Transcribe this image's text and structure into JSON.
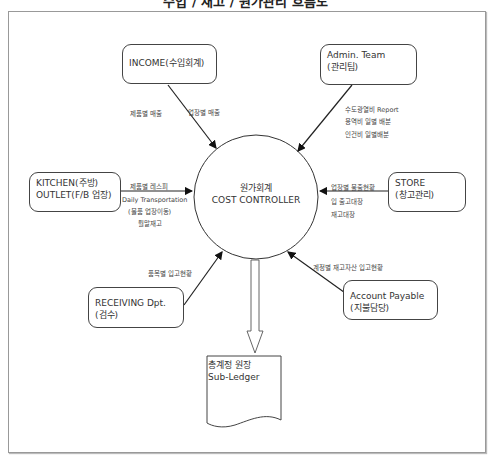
{
  "title": "수입 / 재고 / 원가관리 흐름도",
  "center": {
    "line1": "원가회계",
    "line2": "COST CONTROLLER"
  },
  "boxes": {
    "income": {
      "line1": "INCOME(수입회계)"
    },
    "admin": {
      "line1": "Admin. Team",
      "line2": "(관리팀)"
    },
    "kitchen": {
      "line1": "KITCHEN(주방)",
      "line2": "OUTLET(F/B 업장)"
    },
    "store": {
      "line1": "STORE",
      "line2": "(창고관리)"
    },
    "receiving": {
      "line1": "RECEIVING Dpt.",
      "line2": "(검수)"
    },
    "payable": {
      "line1": "Account Payable",
      "line2": "(지불담당)"
    }
  },
  "labels": {
    "income_a": "제품별 매출",
    "income_b": "업장별 매출",
    "admin_a": "수도광열비 Report",
    "admin_b": "용역비 일별 배분",
    "admin_c": "인건비 일별배분",
    "kitchen_a": "제품별 레스피",
    "kitchen_b": "Daily Transportation",
    "kitchen_c": "(물품 업장이동)",
    "kitchen_d": "월말재고",
    "store_a": "업장별 불출현황",
    "store_b": "입 출고대장",
    "store_c": "재고대장",
    "receiving_a": "품목별 입고현황",
    "payable_a": "계정별 재고자산 입고현황"
  },
  "ledger": {
    "line1": "총계정 원장",
    "line2": "Sub-Ledger"
  }
}
